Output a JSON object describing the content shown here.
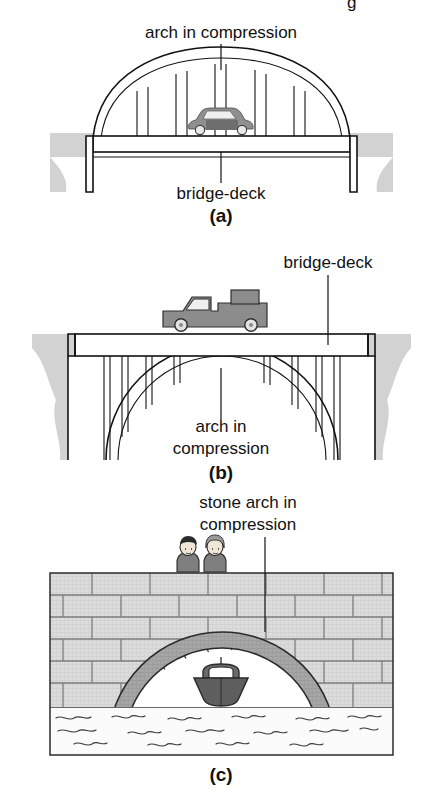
{
  "figure": {
    "title_fragment_top": "g",
    "panels": [
      {
        "id": "a",
        "caption": "(a)",
        "type": "tied-arch-bridge-deck-below-arch",
        "labels": [
          {
            "name": "arch-label",
            "text": "arch in compression"
          },
          {
            "name": "deck-label",
            "text": "bridge-deck"
          }
        ],
        "vehicle": "car",
        "hanger_count": 6,
        "description": "Shallow segmental arch springing from abutments, with vertical hangers supporting a bridge-deck that passes through the arch; a car travels on the deck."
      },
      {
        "id": "b",
        "caption": "(b)",
        "type": "deck-arch-bridge-deck-above-arch",
        "labels": [
          {
            "name": "deck-label",
            "text": "bridge-deck"
          },
          {
            "name": "arch-label-line1",
            "text": "arch in"
          },
          {
            "name": "arch-label-line2",
            "text": "compression"
          }
        ],
        "vehicle": "pickup-truck",
        "column_count": 8,
        "description": "Semicircular arch beneath a flat bridge-deck carried on slender spandrel columns; a pickup truck travels on the deck."
      },
      {
        "id": "c",
        "caption": "(c)",
        "type": "masonry-stone-arch-bridge",
        "labels": [
          {
            "name": "stone-arch-label-line1",
            "text": "stone arch in"
          },
          {
            "name": "stone-arch-label-line2",
            "text": "compression"
          }
        ],
        "people_count": 2,
        "vessel": "boat",
        "voussoir_count": 15,
        "description": "Stone masonry bridge of coursed ashlar blocks with a semicircular ring of voussoirs over water; two people look over the parapet and a boat passes beneath."
      }
    ],
    "colors": {
      "ink": "#111111",
      "page_background": "#ffffff",
      "ground_fill": "#d2d2d2",
      "vehicle_fill": "#8c8c8c",
      "vehicle_dark": "#6e6e6e",
      "masonry_block": "#d8d8d8",
      "masonry_mortar": "#7d7d7d",
      "voussoir_fill": "#a3a3a3",
      "water_fill": "#fbfbfb",
      "boat_fill": "#6a6a6a",
      "glass_fill": "#efefef"
    }
  }
}
